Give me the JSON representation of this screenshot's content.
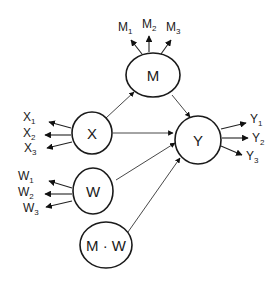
{
  "diagram": {
    "type": "structural-equation-model",
    "colors": {
      "line": "#1a1a1a",
      "background": "#ffffff"
    },
    "latent_variables": [
      {
        "id": "M",
        "label": "M",
        "indicators": [
          {
            "base": "M",
            "sub": "1"
          },
          {
            "base": "M",
            "sub": "2"
          },
          {
            "base": "M",
            "sub": "3"
          }
        ]
      },
      {
        "id": "X",
        "label": "X",
        "indicators": [
          {
            "base": "X",
            "sub": "1"
          },
          {
            "base": "X",
            "sub": "2"
          },
          {
            "base": "X",
            "sub": "3"
          }
        ]
      },
      {
        "id": "W",
        "label": "W",
        "indicators": [
          {
            "base": "W",
            "sub": "1"
          },
          {
            "base": "W",
            "sub": "2"
          },
          {
            "base": "W",
            "sub": "3"
          }
        ]
      },
      {
        "id": "Y",
        "label": "Y",
        "indicators": [
          {
            "base": "Y",
            "sub": "1"
          },
          {
            "base": "Y",
            "sub": "2"
          },
          {
            "base": "Y",
            "sub": "3"
          }
        ]
      },
      {
        "id": "MW",
        "label": "M · W",
        "indicators": []
      }
    ],
    "paths": [
      {
        "from": "X",
        "to": "M"
      },
      {
        "from": "M",
        "to": "Y"
      },
      {
        "from": "X",
        "to": "Y"
      },
      {
        "from": "W",
        "to": "Y"
      },
      {
        "from": "MW",
        "to": "Y"
      }
    ]
  }
}
